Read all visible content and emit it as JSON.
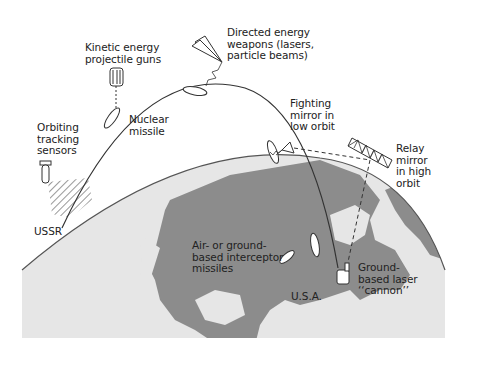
{
  "diagram": {
    "labels": {
      "orbiting_sensors": "Orbiting\ntracking\nsensors",
      "kinetic_guns": "Kinetic energy\nprojectile guns",
      "directed_energy": "Directed energy\nweapons (lasers,\nparticle beams)",
      "nuclear_missile": "Nuclear\nmissile",
      "fighting_mirror": "Fighting\nmirror in\nlow orbit",
      "relay_mirror": "Relay\nmirror\nin high\norbit",
      "ussr": "USSR",
      "interceptor_missiles": "Air- or ground-\nbased interceptor\nmissiles",
      "usa": "U.S.A.",
      "laser_cannon": "Ground-\nbased laser\n‘‘cannon’’"
    },
    "colors": {
      "ocean": "#e6e6e6",
      "land": "#8c8c8c",
      "line": "#333333",
      "text": "#222222"
    }
  }
}
